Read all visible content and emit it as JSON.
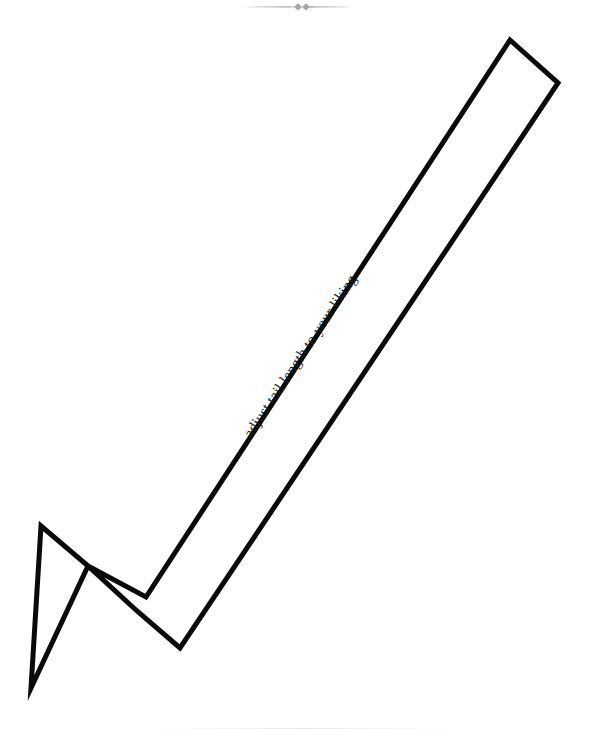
{
  "page": {
    "background_color": "#ffffff",
    "width": 596,
    "height": 729
  },
  "ornament": {
    "name": "decorative-divider",
    "color": "#c9c9c9",
    "description": "faint horizontal rule with two small diamond flourishes at center"
  },
  "arrow": {
    "label": "adjust tail length to your liking",
    "stroke_color": "#0a0a0a",
    "fill_color": "#ffffff",
    "stroke_width": 5,
    "direction": "down-left",
    "rotation_degrees": -56.5,
    "outline_points": "510,40 558,83 180,648 137,611 88,566 31,688 41,526 88,566 146,597",
    "vertices": {
      "tail_top_corner": "510,40",
      "tail_right_corner": "558,83",
      "barb_right_tip": "180,648",
      "notch_lower": "137,611",
      "notch_upper": "88,566",
      "point_tip": "31,688",
      "barb_left_tip": "41,526"
    }
  },
  "bottom_rule": {
    "name": "page-footer-rule",
    "color": "#ededed"
  }
}
